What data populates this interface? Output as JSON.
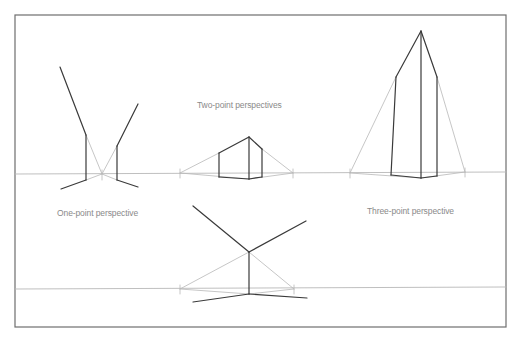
{
  "labels": {
    "one_point": "One-point perspective",
    "two_point": "Two-point perspectives",
    "three_point": "Three-point perspective"
  },
  "colors": {
    "frame": "#6e6e6e",
    "construction": "#b8b8b8",
    "object": "#3a3a3a",
    "text": "#8a8a8a",
    "background": "#ffffff"
  },
  "frame": {
    "x": 15,
    "y": 15,
    "width": 491,
    "height": 312
  },
  "horizons": [
    {
      "x1": 15,
      "y1": 174,
      "x2": 506,
      "y2": 172
    },
    {
      "x1": 15,
      "y1": 289,
      "x2": 506,
      "y2": 287
    }
  ],
  "figures": {
    "one_point": {
      "vanishing_point": [
        102,
        174
      ],
      "construction": [
        [
          86,
          135,
          102,
          174
        ],
        [
          117,
          146,
          102,
          174
        ],
        [
          86,
          180,
          102,
          174
        ],
        [
          117,
          180,
          102,
          174
        ],
        [
          102,
          170,
          102,
          180
        ]
      ],
      "object": [
        [
          60,
          67,
          86,
          135
        ],
        [
          86,
          135,
          86,
          180
        ],
        [
          86,
          180,
          61,
          189
        ],
        [
          138,
          104,
          117,
          146
        ],
        [
          117,
          146,
          117,
          180
        ],
        [
          117,
          180,
          138,
          187
        ]
      ]
    },
    "two_point": {
      "vanishing_points": [
        [
          180,
          173
        ],
        [
          293,
          173
        ]
      ],
      "construction": [
        [
          180,
          173,
          219,
          153
        ],
        [
          262,
          149,
          293,
          173
        ],
        [
          180,
          173,
          249,
          179
        ],
        [
          249,
          179,
          293,
          173
        ],
        [
          180,
          169,
          180,
          178
        ],
        [
          293,
          169,
          293,
          178
        ]
      ],
      "object": [
        [
          219,
          153,
          249,
          137
        ],
        [
          249,
          137,
          262,
          149
        ],
        [
          219,
          153,
          219,
          177
        ],
        [
          249,
          137,
          249,
          179
        ],
        [
          262,
          149,
          262,
          177
        ],
        [
          219,
          177,
          249,
          179
        ],
        [
          249,
          179,
          262,
          177
        ]
      ]
    },
    "three_point": {
      "vanishing_points": [
        [
          350,
          173
        ],
        [
          465,
          172
        ],
        [
          421,
          31
        ]
      ],
      "construction": [
        [
          350,
          173,
          396,
          77
        ],
        [
          465,
          172,
          437,
          77
        ],
        [
          350,
          173,
          421,
          178
        ],
        [
          421,
          178,
          465,
          172
        ],
        [
          350,
          169,
          350,
          178
        ],
        [
          465,
          168,
          465,
          177
        ]
      ],
      "object": [
        [
          421,
          31,
          396,
          77
        ],
        [
          421,
          31,
          437,
          77
        ],
        [
          421,
          31,
          421,
          178
        ],
        [
          396,
          77,
          391,
          175
        ],
        [
          437,
          77,
          437,
          176
        ],
        [
          391,
          175,
          421,
          178
        ],
        [
          421,
          178,
          437,
          176
        ]
      ]
    },
    "bottom_two_point": {
      "vanishing_points": [
        [
          180,
          289
        ],
        [
          294,
          289
        ]
      ],
      "construction": [
        [
          180,
          289,
          249,
          252
        ],
        [
          249,
          252,
          294,
          289
        ],
        [
          180,
          289,
          249,
          294
        ],
        [
          249,
          294,
          294,
          289
        ],
        [
          180,
          285,
          180,
          294
        ],
        [
          294,
          285,
          294,
          294
        ]
      ],
      "object": [
        [
          193,
          206,
          249,
          252
        ],
        [
          306,
          221,
          249,
          252
        ],
        [
          249,
          252,
          249,
          294
        ],
        [
          249,
          294,
          193,
          302
        ],
        [
          249,
          294,
          307,
          298
        ]
      ]
    }
  },
  "label_positions": {
    "one_point": [
      57,
      213
    ],
    "two_point": [
      197,
      105
    ],
    "three_point": [
      367,
      211
    ]
  }
}
